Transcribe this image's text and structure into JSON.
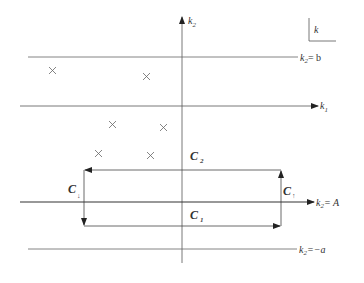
{
  "diagram": {
    "axes": {
      "vertical_label": "k",
      "vertical_sub": "2",
      "horizontal_label": "k",
      "horizontal_sub": "1"
    },
    "plane_label": "k",
    "lines": {
      "upper": {
        "label": "k",
        "sub": "2",
        "rhs": "= b"
      },
      "contour_axis": {
        "label": "k",
        "sub": "2",
        "rhs": "= A"
      },
      "lower": {
        "label": "k",
        "sub": "2",
        "rhs": "=−a"
      }
    },
    "contour_segments": [
      {
        "label": "C",
        "sub": "1"
      },
      {
        "label": "C",
        "sub": "2"
      },
      {
        "label": "C",
        "sub": "↑"
      },
      {
        "label": "C",
        "sub": "↓"
      }
    ],
    "poles_marker": "×"
  }
}
